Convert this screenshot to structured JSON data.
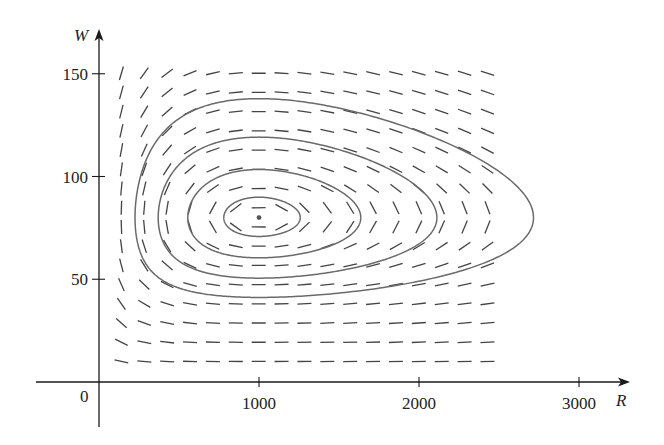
{
  "chart_data": {
    "type": "direction_field_phase_portrait",
    "title": "",
    "xlabel": "R",
    "ylabel": "W",
    "origin_label": "0",
    "x_ticks": [
      1000,
      2000,
      3000
    ],
    "x_tick_labels": [
      "1000",
      "2000",
      "3000"
    ],
    "y_ticks": [
      50,
      100,
      150
    ],
    "y_tick_labels": [
      "50",
      "100",
      "150"
    ],
    "xlim": [
      0,
      3000
    ],
    "ylim": [
      0,
      150
    ],
    "grid": false,
    "legend": null,
    "system": {
      "dR_dt": "0.08R - 0.001RW",
      "dW_dt": "-0.02W + 0.00002RW",
      "a": 0.08,
      "b": 0.001,
      "c": 0.02,
      "d": 2e-05
    },
    "equilibrium_point": {
      "R": 1000,
      "W": 80
    },
    "direction_field": {
      "R_start": 140,
      "R_step": 143,
      "R_count": 17,
      "W_start": 10,
      "W_step": 9.35,
      "W_count": 16
    },
    "trajectories_left_R_at_W80": [
      225,
      370,
      555,
      780
    ],
    "trajectories_extent_approx": [
      {
        "R": [
          225,
          2810
        ],
        "W": [
          41,
          137
        ]
      },
      {
        "R": [
          370,
          2150
        ],
        "W": [
          51,
          120
        ]
      },
      {
        "R": [
          555,
          1650
        ],
        "W": [
          61,
          103
        ]
      },
      {
        "R": [
          780,
          1290
        ],
        "W": [
          71,
          90
        ]
      }
    ]
  },
  "colors": {
    "axis": "#1a1a1a",
    "field_segment": "#444444",
    "trajectory": "#6a6a6a",
    "equilibrium_dot": "#555555"
  }
}
